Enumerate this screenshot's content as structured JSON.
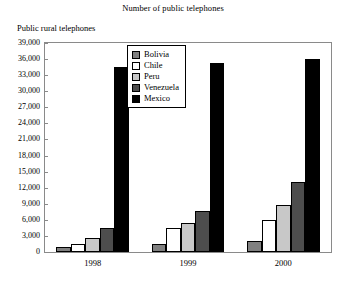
{
  "chart_data": {
    "type": "bar",
    "title": "Number of public telephones",
    "xlabel": "",
    "ylabel": "Public rural telephones",
    "categories": [
      "1998",
      "1999",
      "2000"
    ],
    "series": [
      {
        "name": "Bolivia",
        "color": "#808080",
        "values": [
          900,
          1500,
          2000
        ]
      },
      {
        "name": "Chile",
        "color": "#ffffff",
        "values": [
          1500,
          4500,
          6000
        ]
      },
      {
        "name": "Peru",
        "color": "#c8c8c8",
        "values": [
          2700,
          5500,
          8800
        ]
      },
      {
        "name": "Venezuela",
        "color": "#4d4d4d",
        "values": [
          4500,
          7600,
          13100
        ]
      },
      {
        "name": "Mexico",
        "color": "#000000",
        "values": [
          34600,
          35200,
          36000
        ]
      }
    ],
    "ylim": [
      0,
      39000
    ],
    "yticks": [
      0,
      3000,
      6000,
      9000,
      12000,
      15000,
      18000,
      21000,
      24000,
      27000,
      30000,
      33000,
      36000,
      39000
    ],
    "ytick_labels": [
      "0",
      "3,000",
      "6,000",
      "9,000",
      "12,000",
      "15,000",
      "18,000",
      "21,000",
      "24,000",
      "27,000",
      "30,000",
      "33,000",
      "36,000",
      "39,000"
    ],
    "grid": false,
    "legend_position": "top-center",
    "frame_color": "#8a8a8a",
    "bar_border_color": "#000000"
  }
}
